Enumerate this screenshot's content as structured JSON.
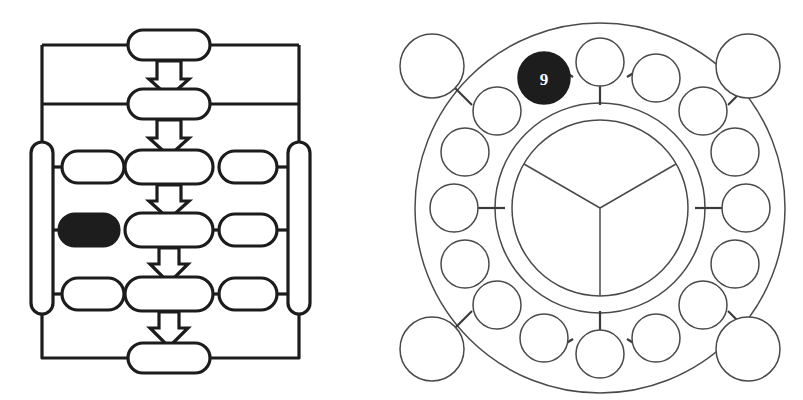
{
  "figure": {
    "background_color": "#ffffff",
    "stroke_color": "#1c1c1c",
    "thin_stroke_color": "#4a4a4a",
    "fill_color": "#ffffff",
    "highlight_color": "#1d1d1d",
    "label_color": "#ffffff"
  },
  "left_diagram": {
    "name": "ladder-flow-diagram",
    "type": "flowchart",
    "description": "Vertical chain of rounded capsule nodes joined by block down-arrows, flanked by side capsules and enclosed by a rectangular bus loop",
    "spine_nodes": [
      {
        "id": "spine-1",
        "label": "",
        "cx": 169,
        "cy": 45,
        "rx": 41,
        "ry": 15,
        "filled": false
      },
      {
        "id": "spine-2",
        "label": "",
        "cx": 169,
        "cy": 104,
        "rx": 41,
        "ry": 15,
        "filled": false
      },
      {
        "id": "spine-3",
        "label": "",
        "cx": 169,
        "cy": 167,
        "rx": 44,
        "ry": 17,
        "filled": false
      },
      {
        "id": "spine-4",
        "label": "",
        "cx": 169,
        "cy": 230,
        "rx": 44,
        "ry": 17,
        "filled": false
      },
      {
        "id": "spine-5",
        "label": "",
        "cx": 169,
        "cy": 294,
        "rx": 44,
        "ry": 17,
        "filled": false
      },
      {
        "id": "spine-6",
        "label": "",
        "cx": 169,
        "cy": 358,
        "rx": 41,
        "ry": 15,
        "filled": false
      }
    ],
    "left_branch_nodes": [
      {
        "id": "left-branch-1",
        "label": "",
        "cx": 93,
        "cy": 167,
        "rx": 31,
        "ry": 16,
        "filled": false
      },
      {
        "id": "left-branch-2",
        "label": "",
        "cx": 89,
        "cy": 230,
        "rx": 30,
        "ry": 16,
        "filled": true
      },
      {
        "id": "left-branch-3",
        "label": "",
        "cx": 93,
        "cy": 294,
        "rx": 31,
        "ry": 16,
        "filled": false
      }
    ],
    "right_branch_nodes": [
      {
        "id": "right-branch-1",
        "label": "",
        "cx": 248,
        "cy": 167,
        "rx": 29,
        "ry": 16,
        "filled": false
      },
      {
        "id": "right-branch-2",
        "label": "",
        "cx": 248,
        "cy": 230,
        "rx": 29,
        "ry": 16,
        "filled": false
      },
      {
        "id": "right-branch-3",
        "label": "",
        "cx": 248,
        "cy": 294,
        "rx": 29,
        "ry": 16,
        "filled": false
      }
    ],
    "side_rails": [
      {
        "id": "rail-left",
        "label": "",
        "cx": 42,
        "cy": 228,
        "rx": 11,
        "ry": 86,
        "filled": false
      },
      {
        "id": "rail-right",
        "label": "",
        "cx": 299,
        "cy": 228,
        "rx": 11,
        "ry": 86,
        "filled": false
      }
    ],
    "arrows": [
      {
        "id": "arrow-1",
        "cx": 169,
        "top": 61,
        "bottom": 89,
        "direction": "down"
      },
      {
        "id": "arrow-2",
        "cx": 169,
        "top": 120,
        "bottom": 149,
        "direction": "down"
      },
      {
        "id": "arrow-3",
        "cx": 169,
        "top": 185,
        "bottom": 213,
        "direction": "down"
      },
      {
        "id": "arrow-4",
        "cx": 169,
        "top": 248,
        "bottom": 277,
        "direction": "down"
      },
      {
        "id": "arrow-5",
        "cx": 169,
        "top": 312,
        "bottom": 342,
        "direction": "down"
      }
    ],
    "bus_loop": {
      "id": "outer-bus-loop",
      "left_x": 42,
      "right_x": 299,
      "top_y": 45,
      "mid_y": 104,
      "bottom_y": 358
    },
    "connector_count": 10
  },
  "right_diagram": {
    "name": "radial-ring-diagram",
    "type": "ring-network",
    "description": "Concentric annulus containing a ring of sixteen circular nodes, a three-sector hub, and four larger satellite circles at the corners",
    "center": {
      "cx": 600,
      "cy": 208
    },
    "outer_ring_radius": 185,
    "inner_ring_radius": 105,
    "hub_radius": 88,
    "hub_sectors": 3,
    "hub_sector_angles_deg": [
      90,
      210,
      330
    ],
    "ring_node_radius": 24,
    "ring_node_orbit_radius": 146,
    "ring_nodes": [
      {
        "id": "ring-node-1",
        "label": "",
        "angle_deg": 270,
        "filled": false
      },
      {
        "id": "ring-node-2",
        "label": "",
        "angle_deg": 292.5,
        "filled": false
      },
      {
        "id": "ring-node-3",
        "label": "",
        "angle_deg": 315,
        "filled": false
      },
      {
        "id": "ring-node-4",
        "label": "",
        "angle_deg": 337.5,
        "filled": false
      },
      {
        "id": "ring-node-5",
        "label": "",
        "angle_deg": 0,
        "filled": false
      },
      {
        "id": "ring-node-6",
        "label": "",
        "angle_deg": 22.5,
        "filled": false
      },
      {
        "id": "ring-node-7",
        "label": "",
        "angle_deg": 45,
        "filled": false
      },
      {
        "id": "ring-node-8",
        "label": "",
        "angle_deg": 67.5,
        "filled": false
      },
      {
        "id": "ring-node-9",
        "label": "",
        "angle_deg": 90,
        "filled": false
      },
      {
        "id": "ring-node-10",
        "label": "",
        "angle_deg": 112.5,
        "filled": false
      },
      {
        "id": "ring-node-11",
        "label": "",
        "angle_deg": 135,
        "filled": false
      },
      {
        "id": "ring-node-12",
        "label": "",
        "angle_deg": 157.5,
        "filled": false
      },
      {
        "id": "ring-node-13",
        "label": "",
        "angle_deg": 180,
        "filled": false
      },
      {
        "id": "ring-node-14",
        "label": "",
        "angle_deg": 202.5,
        "filled": false
      },
      {
        "id": "ring-node-15",
        "label": "",
        "angle_deg": 225,
        "filled": false
      },
      {
        "id": "ring-node-16",
        "label": "9",
        "angle_deg": 247.5,
        "filled": true
      }
    ],
    "highlighted_node": {
      "id": "ring-node-16",
      "label": "9",
      "fill": "#1d1d1d",
      "text_color": "#ffffff"
    },
    "corner_nodes": [
      {
        "id": "corner-node-top-left",
        "label": "",
        "cx": 432,
        "cy": 66,
        "r": 32
      },
      {
        "id": "corner-node-top-right",
        "label": "",
        "cx": 748,
        "cy": 66,
        "r": 32
      },
      {
        "id": "corner-node-bottom-left",
        "label": "",
        "cx": 432,
        "cy": 349,
        "r": 32
      },
      {
        "id": "corner-node-bottom-right",
        "label": "",
        "cx": 748,
        "cy": 349,
        "r": 32
      }
    ],
    "radial_spoke_angles_deg": [
      270,
      0,
      90,
      180
    ],
    "node_count": 20
  }
}
